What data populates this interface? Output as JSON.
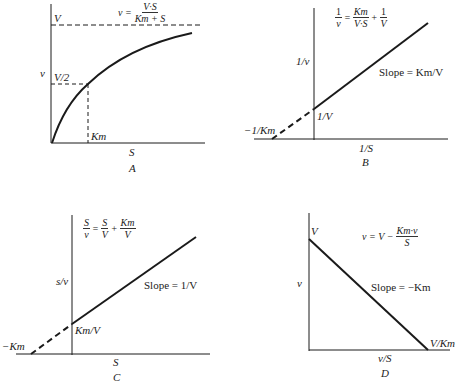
{
  "figure": {
    "panels": [
      {
        "id": "A",
        "caption": "A",
        "title": "Michaelis-Menten plot",
        "equation": {
          "lhs": "v",
          "numerator": "V·S",
          "denominator": "Km + S"
        },
        "xlabel": "S",
        "ylabel": "v",
        "asymptote_label": "V",
        "half_label": "V/2",
        "km_label": "Km"
      },
      {
        "id": "B",
        "caption": "B",
        "title": "Lineweaver-Burk plot",
        "equation": {
          "lhs_num": "1",
          "lhs_den": "v",
          "t1_num": "Km",
          "t1_den": "V·S",
          "t2_num": "1",
          "t2_den": "V"
        },
        "xlabel": "1/S",
        "ylabel": "1/v",
        "slope_label": "Slope = Km/V",
        "y_intercept_label": "1/V",
        "x_intercept_label": "−1/Km"
      },
      {
        "id": "C",
        "caption": "C",
        "title": "Hanes-Woolf plot",
        "equation": {
          "lhs_num": "S",
          "lhs_den": "v",
          "t1_num": "S",
          "t1_den": "V",
          "t2_num": "Km",
          "t2_den": "V"
        },
        "xlabel": "S",
        "ylabel": "s/v",
        "slope_label": "Slope = 1/V",
        "y_intercept_label": "Km/V",
        "x_intercept_label": "−Km"
      },
      {
        "id": "D",
        "caption": "D",
        "title": "Eadie-Hofstee plot",
        "equation": {
          "lhs": "v",
          "t1": "V",
          "frac_num": "Km·v",
          "frac_den": "S"
        },
        "xlabel": "v/S",
        "ylabel": "v",
        "slope_label": "Slope = −Km",
        "y_intercept_label": "V",
        "x_intercept_label": "V/Km"
      }
    ]
  },
  "colors": {
    "ink": "#1a1a1a",
    "background": "#ffffff"
  }
}
